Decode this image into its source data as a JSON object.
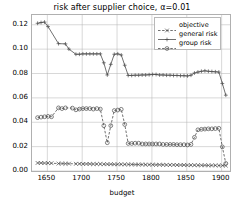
{
  "chart_data": {
    "type": "line",
    "title": "risk after supplier choice, α=0.01",
    "xlabel": "budget",
    "ylabel": "risk",
    "xlim": [
      1628,
      1912
    ],
    "ylim": [
      0.0,
      0.128
    ],
    "xticks": [
      1650,
      1700,
      1750,
      1800,
      1850,
      1900
    ],
    "xtick_labels": [
      "1650",
      "1700",
      "1750",
      "1800",
      "1850",
      "1900"
    ],
    "yticks": [
      0.0,
      0.02,
      0.04,
      0.06,
      0.08,
      0.1,
      0.12
    ],
    "ytick_labels": [
      "0.00",
      "0.02",
      "0.04",
      "0.06",
      "0.08",
      "0.10",
      "0.12"
    ],
    "grid": true,
    "legend_position": "upper right",
    "series": [
      {
        "name": "objective",
        "marker": "x",
        "linestyle": "dashed",
        "color": "#4d4d4d",
        "x": [
          1636,
          1641,
          1646,
          1651,
          1656,
          1666,
          1671,
          1676,
          1681,
          1691,
          1696,
          1701,
          1706,
          1711,
          1716,
          1721,
          1726,
          1731,
          1736,
          1741,
          1746,
          1751,
          1756,
          1761,
          1766,
          1771,
          1776,
          1781,
          1786,
          1791,
          1796,
          1801,
          1806,
          1811,
          1816,
          1821,
          1826,
          1831,
          1836,
          1841,
          1846,
          1851,
          1856,
          1861,
          1866,
          1871,
          1876,
          1881,
          1886,
          1891,
          1896,
          1901,
          1906
        ],
        "y": [
          0.0066,
          0.0066,
          0.0065,
          0.0065,
          0.0064,
          0.0061,
          0.0061,
          0.006,
          0.006,
          0.0059,
          0.0059,
          0.0058,
          0.0058,
          0.0058,
          0.0057,
          0.0057,
          0.0057,
          0.0056,
          0.0056,
          0.0056,
          0.0055,
          0.0055,
          0.0055,
          0.0054,
          0.0054,
          0.0054,
          0.0053,
          0.0053,
          0.0053,
          0.0052,
          0.0052,
          0.0052,
          0.0051,
          0.0051,
          0.0051,
          0.005,
          0.005,
          0.005,
          0.0049,
          0.0049,
          0.0049,
          0.0048,
          0.0048,
          0.0048,
          0.0047,
          0.0047,
          0.0047,
          0.0046,
          0.0046,
          0.0046,
          0.0045,
          0.0045,
          0.0044
        ]
      },
      {
        "name": "general risk",
        "marker": "+",
        "linestyle": "solid",
        "color": "#4d4d4d",
        "x": [
          1636,
          1641,
          1646,
          1651,
          1666,
          1676,
          1681,
          1691,
          1696,
          1701,
          1706,
          1711,
          1716,
          1721,
          1726,
          1731,
          1736,
          1741,
          1746,
          1751,
          1756,
          1761,
          1766,
          1771,
          1776,
          1781,
          1786,
          1791,
          1796,
          1801,
          1806,
          1811,
          1816,
          1821,
          1826,
          1831,
          1836,
          1841,
          1846,
          1851,
          1856,
          1861,
          1866,
          1871,
          1876,
          1881,
          1886,
          1891,
          1896,
          1901,
          1906
        ],
        "y": [
          0.1212,
          0.1218,
          0.1222,
          0.1185,
          0.1045,
          0.1043,
          0.1,
          0.0958,
          0.0958,
          0.0961,
          0.0961,
          0.0961,
          0.0961,
          0.0961,
          0.0961,
          0.0888,
          0.0788,
          0.0875,
          0.0958,
          0.0961,
          0.0952,
          0.0868,
          0.0784,
          0.0784,
          0.0786,
          0.0786,
          0.0788,
          0.0788,
          0.079,
          0.0792,
          0.0792,
          0.0788,
          0.0788,
          0.0786,
          0.0786,
          0.0784,
          0.0784,
          0.0782,
          0.0782,
          0.078,
          0.0786,
          0.0804,
          0.0812,
          0.0818,
          0.0822,
          0.0818,
          0.0816,
          0.0814,
          0.0812,
          0.0718,
          0.0622
        ]
      },
      {
        "name": "group risk",
        "marker": "o",
        "linestyle": "dashed",
        "color": "#4d4d4d",
        "x": [
          1636,
          1641,
          1646,
          1651,
          1656,
          1666,
          1671,
          1676,
          1686,
          1691,
          1696,
          1701,
          1706,
          1711,
          1716,
          1721,
          1726,
          1731,
          1736,
          1741,
          1746,
          1751,
          1756,
          1761,
          1766,
          1771,
          1776,
          1781,
          1786,
          1791,
          1796,
          1801,
          1806,
          1811,
          1816,
          1821,
          1826,
          1831,
          1836,
          1841,
          1846,
          1851,
          1856,
          1861,
          1866,
          1871,
          1876,
          1881,
          1886,
          1891,
          1896,
          1901,
          1906
        ],
        "y": [
          0.0438,
          0.0442,
          0.0445,
          0.0448,
          0.0445,
          0.0518,
          0.0512,
          0.0518,
          0.0516,
          0.0502,
          0.0508,
          0.0512,
          0.0512,
          0.0512,
          0.0508,
          0.0512,
          0.0508,
          0.0372,
          0.0232,
          0.0372,
          0.0496,
          0.05,
          0.0506,
          0.0382,
          0.0226,
          0.0226,
          0.0228,
          0.0228,
          0.0222,
          0.0222,
          0.0222,
          0.0222,
          0.0222,
          0.0222,
          0.0218,
          0.0218,
          0.0218,
          0.0218,
          0.0216,
          0.0216,
          0.0216,
          0.0214,
          0.0218,
          0.0276,
          0.0338,
          0.0342,
          0.0344,
          0.0346,
          0.0346,
          0.0348,
          0.035,
          0.0198,
          0.0062
        ]
      }
    ]
  }
}
